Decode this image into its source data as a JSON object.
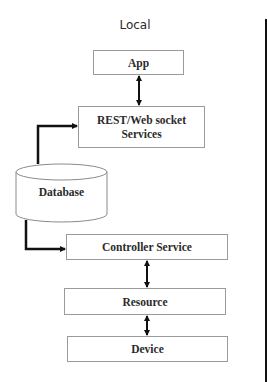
{
  "diagram": {
    "title": "Local",
    "nodes": {
      "app": {
        "label": "App"
      },
      "rest": {
        "label_line1": "REST/Web socket",
        "label_line2": "Services"
      },
      "database": {
        "label": "Database",
        "shape": "cylinder"
      },
      "controller": {
        "label": "Controller Service"
      },
      "resource": {
        "label": "Resource"
      },
      "device": {
        "label": "Device"
      }
    },
    "edges": [
      {
        "from": "App",
        "to": "REST/Web socket Services",
        "type": "bidirectional"
      },
      {
        "from": "Database",
        "to": "REST/Web socket Services",
        "type": "directed"
      },
      {
        "from": "Database",
        "to": "Controller Service",
        "type": "directed"
      },
      {
        "from": "Controller Service",
        "to": "Resource",
        "type": "bidirectional"
      },
      {
        "from": "Resource",
        "to": "Device",
        "type": "bidirectional"
      }
    ],
    "colors": {
      "box_border": "#9a9a9a",
      "arrow": "#111111",
      "text": "#2b2b2b"
    }
  }
}
